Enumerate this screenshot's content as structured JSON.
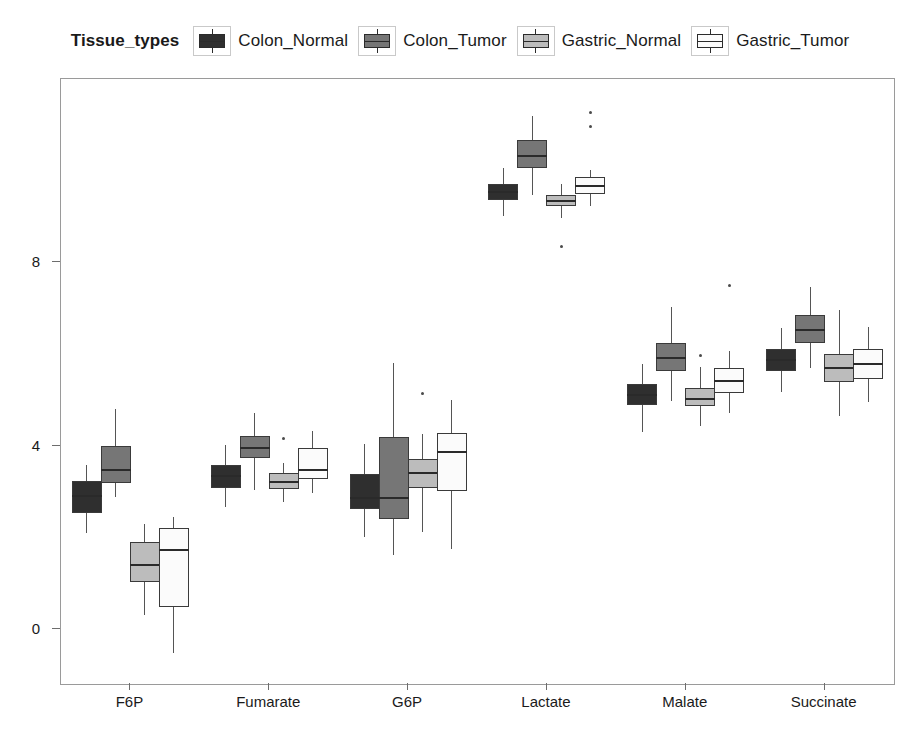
{
  "legend": {
    "title": "Tissue_types",
    "entries": [
      {
        "label": "Colon_Normal",
        "color": "#2f2f2f",
        "key_name": "legend-key-colon-normal"
      },
      {
        "label": "Colon_Tumor",
        "color": "#767676",
        "key_name": "legend-key-colon-tumor"
      },
      {
        "label": "Gastric_Normal",
        "color": "#bcbcbc",
        "key_name": "legend-key-gastric-normal"
      },
      {
        "label": "Gastric_Tumor",
        "color": "#fbfbfb",
        "key_name": "legend-key-gastric-tumor"
      }
    ]
  },
  "chart_data": {
    "type": "box",
    "title": "",
    "xlabel": "",
    "ylabel": "",
    "ylim": [
      -1.2,
      12.0
    ],
    "yticks": [
      0,
      4,
      8
    ],
    "ytick_labels": [
      "0",
      "4",
      "8"
    ],
    "grid": false,
    "legend_position": "top-center",
    "categories": [
      "F6P",
      "Fumarate",
      "G6P",
      "Lactate",
      "Malate",
      "Succinate"
    ],
    "series": [
      {
        "name": "Colon_Normal",
        "color": "#2f2f2f",
        "boxes": [
          {
            "category": "F6P",
            "whisker_low": 2.1,
            "q1": 2.52,
            "median": 2.9,
            "q3": 3.22,
            "whisker_high": 3.58,
            "outliers": []
          },
          {
            "category": "Fumarate",
            "whisker_low": 2.66,
            "q1": 3.08,
            "median": 3.34,
            "q3": 3.58,
            "whisker_high": 4.02,
            "outliers": []
          },
          {
            "category": "G6P",
            "whisker_low": 2.0,
            "q1": 2.62,
            "median": 2.86,
            "q3": 3.38,
            "whisker_high": 4.04,
            "outliers": []
          },
          {
            "category": "Lactate",
            "whisker_low": 9.02,
            "q1": 9.36,
            "median": 9.54,
            "q3": 9.72,
            "whisker_high": 10.06,
            "outliers": []
          },
          {
            "category": "Malate",
            "whisker_low": 4.3,
            "q1": 4.88,
            "median": 5.1,
            "q3": 5.34,
            "whisker_high": 5.78,
            "outliers": []
          },
          {
            "category": "Succinate",
            "whisker_low": 5.16,
            "q1": 5.64,
            "median": 5.88,
            "q3": 6.12,
            "whisker_high": 6.56,
            "outliers": []
          }
        ]
      },
      {
        "name": "Colon_Tumor",
        "color": "#767676",
        "boxes": [
          {
            "category": "F6P",
            "whisker_low": 2.88,
            "q1": 3.18,
            "median": 3.46,
            "q3": 4.0,
            "whisker_high": 4.8,
            "outliers": []
          },
          {
            "category": "Fumarate",
            "whisker_low": 3.04,
            "q1": 3.72,
            "median": 3.94,
            "q3": 4.22,
            "whisker_high": 4.72,
            "outliers": []
          },
          {
            "category": "G6P",
            "whisker_low": 1.62,
            "q1": 2.4,
            "median": 2.86,
            "q3": 4.18,
            "whisker_high": 5.8,
            "outliers": []
          },
          {
            "category": "Lactate",
            "whisker_low": 9.46,
            "q1": 10.06,
            "median": 10.32,
            "q3": 10.66,
            "whisker_high": 11.2,
            "outliers": []
          },
          {
            "category": "Malate",
            "whisker_low": 4.98,
            "q1": 5.64,
            "median": 5.92,
            "q3": 6.24,
            "whisker_high": 7.02,
            "outliers": []
          },
          {
            "category": "Succinate",
            "whisker_low": 5.7,
            "q1": 6.24,
            "median": 6.52,
            "q3": 6.86,
            "whisker_high": 7.46,
            "outliers": []
          }
        ]
      },
      {
        "name": "Gastric_Normal",
        "color": "#bcbcbc",
        "boxes": [
          {
            "category": "F6P",
            "whisker_low": 0.3,
            "q1": 1.02,
            "median": 1.4,
            "q3": 1.9,
            "whisker_high": 2.3,
            "outliers": []
          },
          {
            "category": "Fumarate",
            "whisker_low": 2.78,
            "q1": 3.06,
            "median": 3.2,
            "q3": 3.4,
            "whisker_high": 3.62,
            "outliers": [
              4.16
            ]
          },
          {
            "category": "G6P",
            "whisker_low": 2.12,
            "q1": 3.08,
            "median": 3.4,
            "q3": 3.7,
            "whisker_high": 4.26,
            "outliers": [
              5.14
            ]
          },
          {
            "category": "Lactate",
            "whisker_low": 8.96,
            "q1": 9.22,
            "median": 9.34,
            "q3": 9.46,
            "whisker_high": 9.7,
            "outliers": [
              8.34
            ]
          },
          {
            "category": "Malate",
            "whisker_low": 4.42,
            "q1": 4.86,
            "median": 5.02,
            "q3": 5.26,
            "whisker_high": 5.72,
            "outliers": [
              5.96
            ]
          },
          {
            "category": "Succinate",
            "whisker_low": 4.64,
            "q1": 5.4,
            "median": 5.7,
            "q3": 6.0,
            "whisker_high": 6.96,
            "outliers": []
          }
        ]
      },
      {
        "name": "Gastric_Tumor",
        "color": "#fbfbfb",
        "boxes": [
          {
            "category": "F6P",
            "whisker_low": -0.52,
            "q1": 0.48,
            "median": 1.72,
            "q3": 2.2,
            "whisker_high": 2.44,
            "outliers": []
          },
          {
            "category": "Fumarate",
            "whisker_low": 2.96,
            "q1": 3.28,
            "median": 3.48,
            "q3": 3.94,
            "whisker_high": 4.32,
            "outliers": []
          },
          {
            "category": "G6P",
            "whisker_low": 1.74,
            "q1": 3.02,
            "median": 3.86,
            "q3": 4.28,
            "whisker_high": 5.0,
            "outliers": []
          },
          {
            "category": "Lactate",
            "whisker_low": 9.22,
            "q1": 9.48,
            "median": 9.66,
            "q3": 9.86,
            "whisker_high": 10.02,
            "outliers": [
              10.96,
              11.26
            ]
          },
          {
            "category": "Malate",
            "whisker_low": 4.72,
            "q1": 5.16,
            "median": 5.42,
            "q3": 5.7,
            "whisker_high": 6.06,
            "outliers": [
              7.5
            ]
          },
          {
            "category": "Succinate",
            "whisker_low": 4.96,
            "q1": 5.46,
            "median": 5.78,
            "q3": 6.1,
            "whisker_high": 6.58,
            "outliers": []
          }
        ]
      }
    ]
  }
}
